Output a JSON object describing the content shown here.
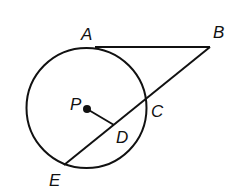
{
  "diagram": {
    "type": "geometry",
    "labels": {
      "A": "A",
      "B": "B",
      "C": "C",
      "D": "D",
      "E": "E",
      "P": "P"
    },
    "colors": {
      "stroke": "#111111",
      "background": "#ffffff"
    }
  }
}
